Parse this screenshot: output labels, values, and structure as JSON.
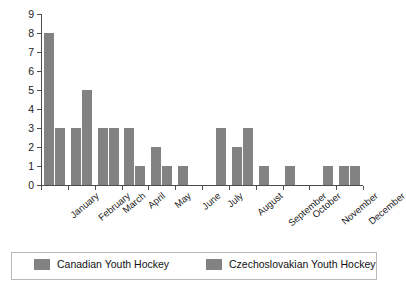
{
  "chart_data": {
    "type": "bar",
    "title": "",
    "subtitle": "",
    "xlabel": "",
    "ylabel": "",
    "ylim": [
      0,
      9
    ],
    "yticks": [
      0,
      1,
      2,
      3,
      4,
      5,
      6,
      7,
      8,
      9
    ],
    "grid": false,
    "legend_position": "bottom",
    "categories": [
      "January",
      "February",
      "March",
      "April",
      "May",
      "June",
      "July",
      "August",
      "September",
      "October",
      "November",
      "December"
    ],
    "series": [
      {
        "name": "Canadian Youth Hockey",
        "color": "#828282",
        "values": [
          8,
          3,
          3,
          3,
          2,
          1,
          0,
          2,
          1,
          1,
          0,
          1
        ]
      },
      {
        "name": "Czechoslovakian Youth Hockey",
        "color": "#828282",
        "values": [
          3,
          5,
          3,
          1,
          1,
          0,
          3,
          3,
          0,
          0,
          1,
          1
        ]
      }
    ]
  },
  "legend": {
    "items": [
      {
        "label": "Canadian Youth Hockey",
        "color": "#828282"
      },
      {
        "label": "Czechoslovakian Youth Hockey",
        "color": "#828282"
      }
    ]
  }
}
